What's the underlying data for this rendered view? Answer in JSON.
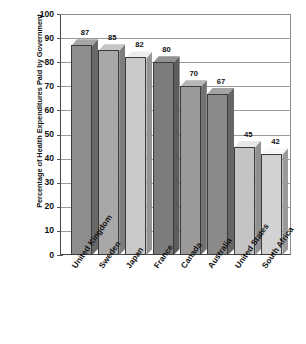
{
  "chart_data": {
    "type": "bar",
    "title": "",
    "xlabel": "",
    "ylabel": "Percentage of Health Expenditures Paid by Government",
    "ylim": [
      0,
      100
    ],
    "yticks": [
      100,
      90,
      80,
      70,
      60,
      50,
      40,
      30,
      20,
      10,
      0
    ],
    "grid": true,
    "legend": "none",
    "three_d": true,
    "categories": [
      "United Kingdom",
      "Sweden",
      "Japan",
      "France",
      "Canada",
      "Australia",
      "United States",
      "South Africa"
    ],
    "values": [
      87,
      85,
      82,
      80,
      70,
      67,
      45,
      42
    ],
    "data_labels": [
      "87",
      "85",
      "82",
      "80",
      "70",
      "67",
      "45",
      "42"
    ],
    "bar_colors": [
      "#8d8d8d",
      "#a8a8a8",
      "#c9c9c9",
      "#7c7c7c",
      "#9a9a9a",
      "#8a8a8a",
      "#c4c4c4",
      "#d2d2d2"
    ]
  },
  "axis": {
    "y_title": "Percentage of Health Expenditures Paid by Government",
    "y_tick_labels": [
      "100",
      "90",
      "80",
      "70",
      "60",
      "50",
      "40",
      "30",
      "20",
      "10",
      "0"
    ]
  },
  "colors": {
    "background": "#ffffff",
    "axis_line": "#4a4a4a",
    "gridline": "#9a9a9a",
    "text": "#111111"
  }
}
